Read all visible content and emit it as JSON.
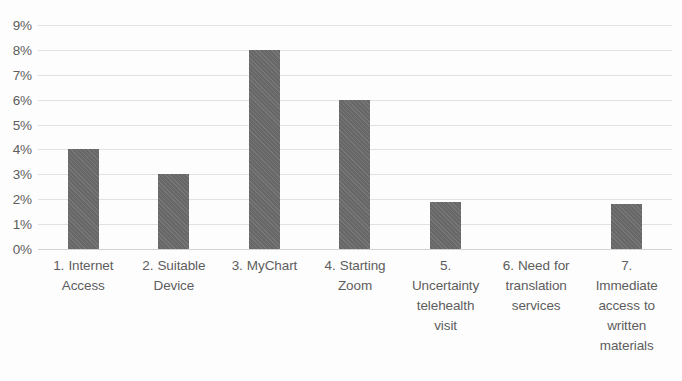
{
  "chart_data": {
    "type": "bar",
    "title": "",
    "subtitle": "",
    "xlabel": "",
    "ylabel": "",
    "ylim": [
      0,
      9
    ],
    "y_tick_labels": [
      "9%",
      "8%",
      "7%",
      "6%",
      "5%",
      "4%",
      "3%",
      "2%",
      "1%",
      "0%"
    ],
    "y_tick_values": [
      9,
      8,
      7,
      6,
      5,
      4,
      3,
      2,
      1,
      0
    ],
    "grid": true,
    "legend": false,
    "legend_position": "none",
    "bar_color": "#6d6d6d",
    "gridline_color": "#e2e2e2",
    "text_color": "#5d5d5d",
    "categories": [
      "1. Internet Access",
      "2. Suitable Device",
      "3. MyChart",
      "4. Starting Zoom",
      "5. Uncertainty telehealth visit",
      "6. Need for translation services",
      "7. Immediate access to written materials"
    ],
    "category_lines": [
      [
        "1. Internet",
        "Access"
      ],
      [
        "2. Suitable",
        "Device"
      ],
      [
        "3. MyChart"
      ],
      [
        "4. Starting",
        "Zoom"
      ],
      [
        "5.",
        "Uncertainty",
        "telehealth",
        "visit"
      ],
      [
        "6. Need for",
        "translation",
        "services"
      ],
      [
        "7.",
        "Immediate",
        "access to",
        "written",
        "materials"
      ]
    ],
    "values": [
      4.0,
      3.0,
      8.0,
      6.0,
      1.9,
      0.0,
      1.8
    ],
    "value_labels": [
      "4%",
      "3%",
      "8%",
      "6%",
      "1.9%",
      "0%",
      "1.8%"
    ]
  }
}
